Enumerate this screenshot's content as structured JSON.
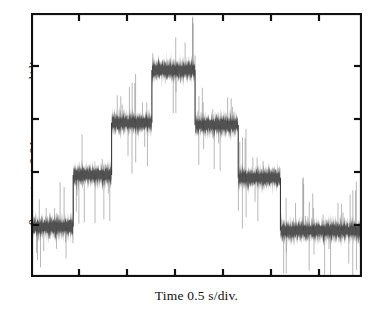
{
  "figure": {
    "background": "#ffffff",
    "axis_color": "#111111",
    "trace_color": "#3a3a3a",
    "trace_noise_color": "#9a9a9a"
  },
  "axes": {
    "y_label_prefix": "θ",
    "y_label_subscript": "Y",
    "y_label_suffix": " -output  0.01 arc-second/div.",
    "x_label": "Time  0.5 s/div.",
    "frame": {
      "left": 31,
      "top": 13,
      "width": 331,
      "height": 264
    },
    "tick_inward": true,
    "tick_length": 7,
    "x_ticks": [
      79,
      127,
      175,
      223,
      271,
      319
    ],
    "y_ticks": [
      66,
      119,
      172,
      225
    ],
    "grid": false
  },
  "chart_data": {
    "type": "line",
    "title": "",
    "xlabel": "Time  0.5 s/div.",
    "ylabel": "θY -output  0.01 arc-second/div.",
    "xlim": [
      0,
      6.9
    ],
    "ylim": [
      0,
      5.0
    ],
    "x_units": "s (0.5 s per division)",
    "y_units": "arc-second (0.01 arc-second per division)",
    "series": [
      {
        "name": "theta-Y output",
        "type": "step-with-noise",
        "noise_amplitude_div": 0.42,
        "steps": [
          {
            "index": 0,
            "x_start": 0.0,
            "x_end": 0.88,
            "level_div": 0.95
          },
          {
            "index": 1,
            "x_start": 0.88,
            "x_end": 1.68,
            "level_div": 1.93
          },
          {
            "index": 2,
            "x_start": 1.68,
            "x_end": 2.52,
            "level_div": 2.92
          },
          {
            "index": 3,
            "x_start": 2.52,
            "x_end": 3.42,
            "level_div": 3.92
          },
          {
            "index": 4,
            "x_start": 3.42,
            "x_end": 4.32,
            "level_div": 2.88
          },
          {
            "index": 5,
            "x_start": 4.32,
            "x_end": 5.2,
            "level_div": 1.88
          },
          {
            "index": 6,
            "x_start": 5.2,
            "x_end": 6.9,
            "level_div": 0.88
          }
        ],
        "step_levels_div": [
          0.95,
          1.93,
          2.92,
          3.92,
          2.88,
          1.88,
          0.88
        ],
        "step_count": 7,
        "plateau_count": 7
      }
    ],
    "legend": {
      "visible": false,
      "entries": []
    },
    "annotations": []
  }
}
